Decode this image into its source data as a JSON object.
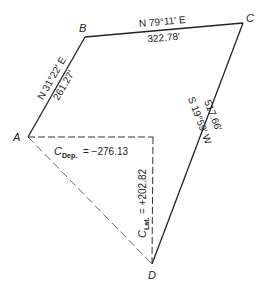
{
  "diagram": {
    "type": "traverse-closure",
    "points": {
      "A": {
        "label": "A",
        "x": 28,
        "y": 137
      },
      "B": {
        "label": "B",
        "x": 85,
        "y": 37
      },
      "C": {
        "label": "C",
        "x": 243,
        "y": 23
      },
      "D": {
        "label": "D",
        "x": 152,
        "y": 264
      },
      "corner": {
        "x": 153,
        "y": 137
      }
    },
    "courses": {
      "AB": {
        "bearing": "N 31°22′ E",
        "distance": "261.27′"
      },
      "BC": {
        "bearing": "N 79°11′ E",
        "distance": "322.78′"
      },
      "CD": {
        "bearing": "S 19°59′ W",
        "distance": "517.66′"
      }
    },
    "closure": {
      "dep_symbol": "C",
      "dep_subscript": "Dep.",
      "dep_value": "= −276.13",
      "lat_symbol": "C",
      "lat_subscript": "Lat.",
      "lat_value": "= +202.82"
    },
    "colors": {
      "line": "#222222",
      "text": "#222222",
      "background": "#ffffff"
    }
  }
}
